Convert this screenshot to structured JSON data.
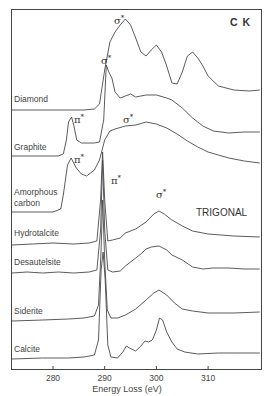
{
  "chart_data": {
    "type": "line",
    "title": "C K",
    "annotation": "TRIGONAL",
    "xlabel": "Energy Loss (eV)",
    "ylabel": "",
    "xlim": [
      272,
      320
    ],
    "xticks": [
      280,
      290,
      300,
      310
    ],
    "grid": false,
    "legend": "inline labels at left of each stacked spectrum",
    "series": [
      {
        "name": "Diamond",
        "label_pos": [
          18,
          100
        ],
        "peaks": [
          {
            "label": "σ*",
            "x": 115,
            "y": 24
          }
        ],
        "points": [
          [
            272,
            110
          ],
          [
            286,
            110
          ],
          [
            288,
            109
          ],
          [
            289,
            104
          ],
          [
            290,
            70
          ],
          [
            291,
            42
          ],
          [
            292,
            32
          ],
          [
            293,
            25
          ],
          [
            294,
            19
          ],
          [
            295,
            25
          ],
          [
            296,
            38
          ],
          [
            297,
            52
          ],
          [
            298,
            56
          ],
          [
            299,
            50
          ],
          [
            300,
            45
          ],
          [
            301,
            52
          ],
          [
            302,
            66
          ],
          [
            303,
            83
          ],
          [
            304,
            84
          ],
          [
            305,
            72
          ],
          [
            306,
            56
          ],
          [
            307,
            52
          ],
          [
            308,
            58
          ],
          [
            309,
            66
          ],
          [
            310,
            76
          ],
          [
            312,
            86
          ],
          [
            315,
            90
          ],
          [
            318,
            91
          ],
          [
            320,
            90
          ]
        ]
      },
      {
        "name": "Graphite",
        "label_pos": [
          18,
          146
        ],
        "peaks": [
          {
            "label": "π*",
            "x": 74,
            "y": 121
          },
          {
            "label": "σ*",
            "x": 129,
            "y": 118
          }
        ],
        "points": [
          [
            272,
            156
          ],
          [
            281,
            156
          ],
          [
            282,
            154
          ],
          [
            282.6,
            140
          ],
          [
            283,
            122
          ],
          [
            283.6,
            117
          ],
          [
            284,
            125
          ],
          [
            284.6,
            140
          ],
          [
            285.5,
            143
          ],
          [
            288,
            143
          ],
          [
            289,
            142
          ],
          [
            289.8,
            120
          ],
          [
            290.3,
            65
          ],
          [
            290.8,
            72
          ],
          [
            291.4,
            78
          ],
          [
            292,
            92
          ],
          [
            293,
            98
          ],
          [
            294,
            96
          ],
          [
            295,
            94
          ],
          [
            296,
            97
          ],
          [
            298,
            95
          ],
          [
            300,
            95
          ],
          [
            302,
            98
          ],
          [
            303,
            100
          ],
          [
            305,
            108
          ],
          [
            307,
            118
          ],
          [
            309,
            126
          ],
          [
            311,
            131
          ],
          [
            314,
            133
          ],
          [
            317,
            132
          ],
          [
            320,
            132
          ]
        ]
      },
      {
        "name": "Amorphous carbon",
        "label_pos": [
          18,
          196
        ],
        "label2_pos": [
          18,
          207
        ],
        "peaks": [
          {
            "label": "π*",
            "x": 74,
            "y": 162
          }
        ],
        "points": [
          [
            272,
            212
          ],
          [
            280,
            212
          ],
          [
            281.5,
            209
          ],
          [
            282,
            195
          ],
          [
            282.8,
            165
          ],
          [
            283.5,
            158
          ],
          [
            284.5,
            168
          ],
          [
            285.5,
            174
          ],
          [
            286.5,
            176
          ],
          [
            288,
            170
          ],
          [
            289,
            160
          ],
          [
            290,
            140
          ],
          [
            291,
            131
          ],
          [
            292,
            129
          ],
          [
            294,
            126
          ],
          [
            296,
            125
          ],
          [
            298,
            122
          ],
          [
            300,
            124
          ],
          [
            302,
            128
          ],
          [
            304,
            134
          ],
          [
            306,
            141
          ],
          [
            308,
            147
          ],
          [
            310,
            152
          ],
          [
            312,
            155
          ],
          [
            314,
            158
          ],
          [
            317,
            161
          ],
          [
            320,
            163
          ]
        ]
      },
      {
        "name": "Hydrotalcite",
        "label_pos": [
          18,
          236
        ],
        "peaks": [
          {
            "label": "π*",
            "x": 111,
            "y": 180
          },
          {
            "label": "σ*",
            "x": 159,
            "y": 196
          }
        ],
        "points": [
          [
            272,
            245
          ],
          [
            276,
            244
          ],
          [
            280,
            243
          ],
          [
            284,
            244
          ],
          [
            287,
            243
          ],
          [
            288.5,
            241
          ],
          [
            289.2,
            200
          ],
          [
            289.6,
            152
          ],
          [
            290.0,
            200
          ],
          [
            290.6,
            241
          ],
          [
            291.5,
            240
          ],
          [
            293,
            238
          ],
          [
            294,
            233
          ],
          [
            296,
            229
          ],
          [
            298,
            222
          ],
          [
            299.5,
            214
          ],
          [
            300.5,
            211
          ],
          [
            301.5,
            214
          ],
          [
            303,
            220
          ],
          [
            305,
            226
          ],
          [
            307,
            231
          ],
          [
            310,
            234
          ],
          [
            315,
            236
          ],
          [
            320,
            237
          ]
        ]
      },
      {
        "name": "Desautelsite",
        "label_pos": [
          18,
          266
        ],
        "points": [
          [
            272,
            273
          ],
          [
            275,
            272
          ],
          [
            278,
            273
          ],
          [
            281,
            272
          ],
          [
            284,
            273
          ],
          [
            287,
            272
          ],
          [
            288.5,
            270
          ],
          [
            289.2,
            230
          ],
          [
            289.6,
            160
          ],
          [
            290.0,
            230
          ],
          [
            290.6,
            270
          ],
          [
            291.5,
            272
          ],
          [
            293,
            271
          ],
          [
            294,
            266
          ],
          [
            295,
            262
          ],
          [
            296,
            258
          ],
          [
            297,
            254
          ],
          [
            298,
            249
          ],
          [
            299,
            247
          ],
          [
            300.5,
            246
          ],
          [
            302,
            250
          ],
          [
            303,
            255
          ],
          [
            305,
            260
          ],
          [
            307,
            267
          ],
          [
            309,
            269
          ],
          [
            311,
            268
          ],
          [
            314,
            268
          ],
          [
            317,
            269
          ],
          [
            320,
            269
          ]
        ]
      },
      {
        "name": "Siderite",
        "label_pos": [
          18,
          314
        ],
        "points": [
          [
            272,
            321
          ],
          [
            278,
            320
          ],
          [
            283,
            319
          ],
          [
            286,
            318
          ],
          [
            288,
            316
          ],
          [
            288.8,
            305
          ],
          [
            289.3,
            250
          ],
          [
            289.6,
            200
          ],
          [
            290.0,
            260
          ],
          [
            290.5,
            310
          ],
          [
            291.2,
            318
          ],
          [
            292.5,
            318
          ],
          [
            294,
            315
          ],
          [
            296,
            309
          ],
          [
            298,
            300
          ],
          [
            299.5,
            293
          ],
          [
            300.5,
            290
          ],
          [
            302,
            295
          ],
          [
            303.5,
            303
          ],
          [
            305,
            309
          ],
          [
            307,
            311
          ],
          [
            310,
            313
          ],
          [
            315,
            313
          ],
          [
            320,
            312
          ]
        ]
      },
      {
        "name": "Calcite",
        "label_pos": [
          18,
          352
        ],
        "points": [
          [
            272,
            359
          ],
          [
            278,
            358
          ],
          [
            283,
            358
          ],
          [
            286,
            357
          ],
          [
            288,
            355
          ],
          [
            288.8,
            340
          ],
          [
            289.3,
            270
          ],
          [
            289.7,
            252
          ],
          [
            290.1,
            280
          ],
          [
            290.6,
            345
          ],
          [
            291.2,
            357
          ],
          [
            292.5,
            358
          ],
          [
            293.5,
            352
          ],
          [
            294.2,
            346
          ],
          [
            294.8,
            348
          ],
          [
            296,
            351
          ],
          [
            297,
            346
          ],
          [
            297.8,
            341
          ],
          [
            298.5,
            342
          ],
          [
            299.2,
            340
          ],
          [
            300,
            330
          ],
          [
            300.6,
            318
          ],
          [
            301.2,
            320
          ],
          [
            302,
            332
          ],
          [
            303,
            342
          ],
          [
            304,
            349
          ],
          [
            305.5,
            352
          ],
          [
            308,
            354
          ],
          [
            312,
            353
          ],
          [
            316,
            353
          ],
          [
            320,
            353
          ]
        ]
      }
    ]
  },
  "labels": {
    "title": "C K",
    "annotation": "TRIGONAL",
    "xlabel": "Energy Loss (eV)",
    "ticks": [
      "280",
      "290",
      "300",
      "310"
    ],
    "series": [
      "Diamond",
      "Graphite",
      "Amorphous",
      "carbon",
      "Hydrotalcite",
      "Desautelsite",
      "Siderite",
      "Calcite"
    ],
    "sigma": "σ",
    "pi": "π",
    "star": "*"
  }
}
